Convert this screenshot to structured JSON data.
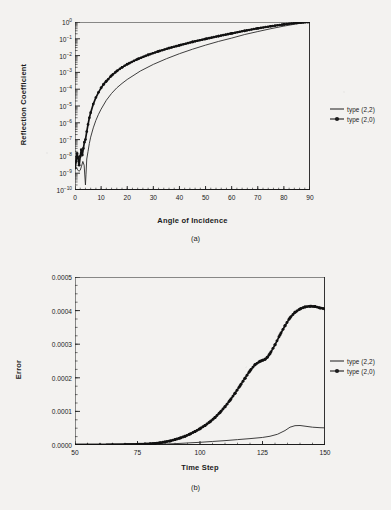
{
  "figure": {
    "background_color": "#f3f2f0",
    "ink_color": "#1c1c1c"
  },
  "panel_a": {
    "caption": "(a)",
    "legend": [
      {
        "label": "type (2,2)",
        "marker": "line"
      },
      {
        "label": "type (2,0)",
        "marker": "line-with-points"
      }
    ]
  },
  "panel_b": {
    "caption": "(b)",
    "legend": [
      {
        "label": "type (2,2)",
        "marker": "line"
      },
      {
        "label": "type (2,0)",
        "marker": "line-with-points"
      }
    ]
  },
  "chart_data": [
    {
      "type": "line",
      "panel": "(a)",
      "title": "",
      "xlabel": "Angle of Incidence",
      "ylabel": "Reflection Coefficient",
      "yscale": "log",
      "xlim": [
        0,
        90
      ],
      "ylim": [
        1e-10,
        1
      ],
      "xticks": [
        0,
        10,
        20,
        30,
        40,
        50,
        60,
        70,
        80,
        90
      ],
      "xticklabels": [
        "0",
        "10",
        "20",
        "30",
        "40",
        "50",
        "60",
        "70",
        "80",
        "90"
      ],
      "yticks": [
        1,
        0.1,
        0.01,
        0.001,
        0.0001,
        1e-05,
        1e-06,
        1e-07,
        1e-08,
        1e-09,
        1e-10
      ],
      "yticklabels": [
        "10^0",
        "10^-1",
        "10^-2",
        "10^-3",
        "10^-4",
        "10^-5",
        "10^-6",
        "10^-7",
        "10^-8",
        "10^-9",
        "10^-10"
      ],
      "grid": false,
      "legend_position": "right-outside",
      "series": [
        {
          "name": "type (2,2)",
          "style": "thin-line",
          "x": [
            0,
            0.5,
            1,
            1.5,
            2,
            2.5,
            3,
            3.5,
            4,
            4.2,
            4.5,
            5,
            5.5,
            6,
            7,
            8,
            9,
            10,
            12,
            14,
            16,
            18,
            20,
            25,
            30,
            35,
            40,
            45,
            50,
            55,
            60,
            65,
            70,
            75,
            80,
            85,
            90
          ],
          "y": [
            3e-09,
            2.2e-09,
            1.6e-09,
            1.3e-09,
            1.5e-09,
            2.6e-09,
            5e-09,
            3e-09,
            2e-10,
            8e-10,
            7e-09,
            2e-08,
            6e-08,
            1.4e-07,
            5e-07,
            1.4e-06,
            3.2e-06,
            6.5e-06,
            2.2e-05,
            5.6e-05,
            0.00012,
            0.00022,
            0.00038,
            0.0012,
            0.003,
            0.0065,
            0.013,
            0.024,
            0.042,
            0.07,
            0.11,
            0.18,
            0.27,
            0.4,
            0.57,
            0.78,
            1.0
          ]
        },
        {
          "name": "type (2,0)",
          "style": "thick-line-with-markers",
          "x": [
            0,
            0.4,
            0.8,
            1.2,
            1.6,
            2,
            2.4,
            2.8,
            3.2,
            3.6,
            4,
            4.5,
            5,
            5.5,
            6,
            7,
            8,
            9,
            10,
            11,
            12,
            14,
            16,
            18,
            20,
            24,
            28,
            32,
            36,
            40,
            45,
            50,
            55,
            60,
            65,
            70,
            75,
            80,
            85,
            90
          ],
          "y": [
            2e-09,
            5e-09,
            1.5e-08,
            8e-09,
            3e-09,
            1e-08,
            2.5e-08,
            1.2e-08,
            3e-08,
            7e-08,
            1e-07,
            3e-07,
            8e-07,
            2e-06,
            4e-06,
            1.3e-05,
            3.2e-05,
            6.5e-05,
            0.00012,
            0.0002,
            0.0003,
            0.00065,
            0.0012,
            0.002,
            0.0031,
            0.0062,
            0.011,
            0.018,
            0.028,
            0.041,
            0.065,
            0.098,
            0.145,
            0.21,
            0.3,
            0.42,
            0.56,
            0.72,
            0.88,
            1.0
          ]
        }
      ]
    },
    {
      "type": "line",
      "panel": "(b)",
      "title": "",
      "xlabel": "Time Step",
      "ylabel": "Error",
      "yscale": "linear",
      "xlim": [
        50,
        150
      ],
      "ylim": [
        0,
        0.0005
      ],
      "xticks": [
        50,
        75,
        100,
        125,
        150
      ],
      "xticklabels": [
        "50",
        "75",
        "100",
        "125",
        "150"
      ],
      "yticks": [
        0,
        0.0001,
        0.0002,
        0.0003,
        0.0004,
        0.0005
      ],
      "yticklabels": [
        "0.0000",
        "0.0001",
        "0.0002",
        "0.0003",
        "0.0004",
        "0.0005"
      ],
      "grid": false,
      "legend_position": "right-outside",
      "series": [
        {
          "name": "type (2,2)",
          "style": "thin-line",
          "x": [
            50,
            60,
            70,
            75,
            80,
            85,
            90,
            95,
            100,
            105,
            110,
            115,
            120,
            125,
            128,
            131,
            134,
            136,
            138,
            140,
            142,
            145,
            148,
            150
          ],
          "y": [
            0.0,
            0.0,
            5e-07,
            1e-06,
            1.5e-06,
            2.5e-06,
            4e-06,
            6e-06,
            8e-06,
            1.05e-05,
            1.3e-05,
            1.6e-05,
            1.9e-05,
            2.25e-05,
            2.6e-05,
            3.2e-05,
            4.3e-05,
            5.3e-05,
            5.75e-05,
            5.8e-05,
            5.6e-05,
            5.3e-05,
            5.15e-05,
            5.1e-05
          ]
        },
        {
          "name": "type (2,0)",
          "style": "thick-line-with-markers",
          "x": [
            50,
            55,
            60,
            65,
            70,
            75,
            78,
            80,
            82,
            84,
            86,
            88,
            90,
            92,
            94,
            96,
            98,
            100,
            102,
            104,
            106,
            108,
            110,
            112,
            114,
            116,
            118,
            120,
            122,
            124,
            125,
            126,
            127,
            128,
            130,
            132,
            134,
            136,
            138,
            140,
            142,
            144,
            146,
            148,
            150
          ],
          "y": [
            0.0,
            2e-07,
            4e-07,
            7e-07,
            1.2e-06,
            2e-06,
            2.8e-06,
            3.6e-06,
            4.8e-06,
            6.5e-06,
            9e-06,
            1.2e-05,
            1.6e-05,
            2.05e-05,
            2.6e-05,
            3.25e-05,
            4e-05,
            4.85e-05,
            5.8e-05,
            6.9e-05,
            8.2e-05,
            9.7e-05,
            0.000114,
            0.000133,
            0.000154,
            0.000176,
            0.000199,
            0.000221,
            0.000239,
            0.000249,
            0.000252,
            0.000255,
            0.000262,
            0.000272,
            0.000298,
            0.000328,
            0.000355,
            0.000379,
            0.000395,
            0.000405,
            0.000411,
            0.000413,
            0.000412,
            0.000408,
            0.000405
          ]
        }
      ]
    }
  ]
}
